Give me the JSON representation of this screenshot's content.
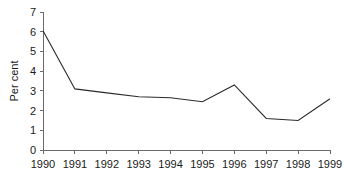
{
  "chart_data": {
    "type": "line",
    "title": "",
    "subtitle": "",
    "xlabel": "",
    "ylabel": "Per cent",
    "categories": [
      "1990",
      "1991",
      "1992",
      "1993",
      "1994",
      "1995",
      "1996",
      "1997",
      "1998",
      "1999"
    ],
    "values": [
      6.05,
      3.1,
      2.9,
      2.7,
      2.65,
      2.45,
      3.3,
      1.6,
      1.5,
      2.6
    ],
    "series": [
      {
        "name": "Per cent",
        "values": [
          6.05,
          3.1,
          2.9,
          2.7,
          2.65,
          2.45,
          3.3,
          1.6,
          1.5,
          2.6
        ]
      }
    ],
    "ylim": [
      0,
      7
    ],
    "yticks": [
      0,
      1,
      2,
      3,
      4,
      5,
      6,
      7
    ],
    "ytick_labels": [
      "0",
      "1",
      "2",
      "3",
      "4",
      "5",
      "6",
      "7"
    ],
    "xtick_labels": [
      "1990",
      "1991",
      "1992",
      "1993",
      "1994",
      "1995",
      "1996",
      "1997",
      "1998",
      "1999"
    ],
    "grid": false,
    "legend": false,
    "legend_position": "none",
    "line_color": "#2b2b2b",
    "axis_color": "#6b6b6b",
    "background_color": "#ffffff"
  }
}
